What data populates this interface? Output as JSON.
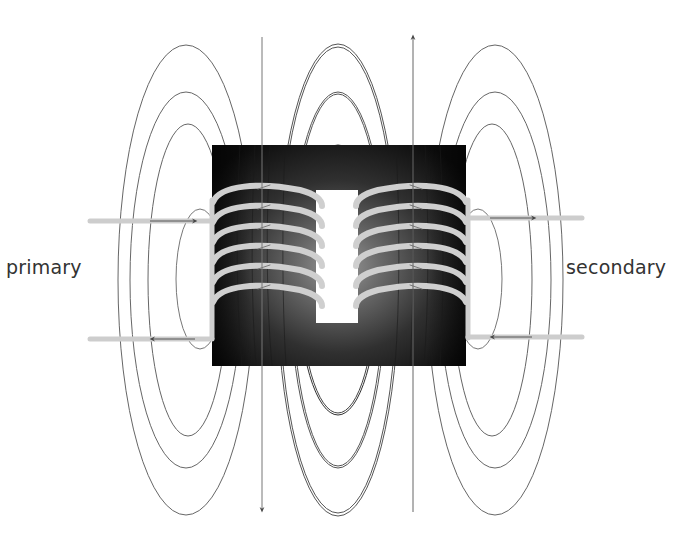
{
  "diagram": {
    "labels": {
      "primary": "primary",
      "secondary": "secondary"
    },
    "components": {
      "core": {
        "shape": "rectangular iron core with central window",
        "fill": "dark gradient"
      },
      "primary_coil": {
        "side": "left",
        "turns": 6
      },
      "secondary_coil": {
        "side": "right",
        "turns": 6
      },
      "primary_leads": {
        "count": 2,
        "top_arrow": "right",
        "bottom_arrow": "left"
      },
      "secondary_leads": {
        "count": 2,
        "top_arrow": "right",
        "bottom_arrow": "left"
      }
    },
    "field_lines": {
      "groups": [
        "left",
        "center",
        "right"
      ],
      "loops_per_group": 3,
      "left_axis_arrow": "down",
      "right_axis_arrow": "up"
    },
    "colors": {
      "background": "#ffffff",
      "core_dark": "#111111",
      "core_light": "#8a8a8a",
      "coil_wire": "#c9c9c9",
      "field_line": "#555555",
      "label_text": "#333333"
    }
  }
}
